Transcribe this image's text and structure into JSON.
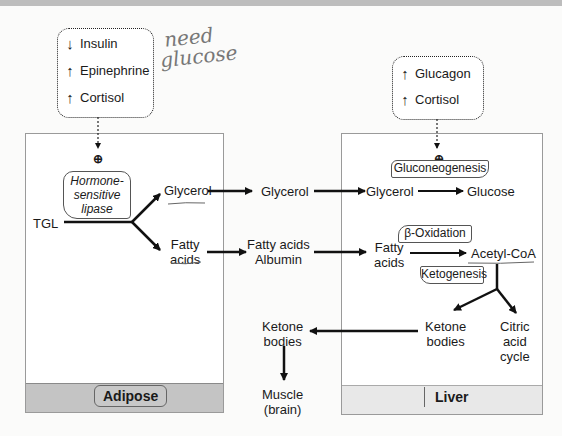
{
  "adipose_hormones": [
    {
      "direction": "down",
      "label": "Insulin"
    },
    {
      "direction": "up",
      "label": "Epinephrine"
    },
    {
      "direction": "up",
      "label": "Cortisol"
    }
  ],
  "liver_hormones": [
    {
      "direction": "up",
      "label": "Glucagon"
    },
    {
      "direction": "up",
      "label": "Cortisol"
    }
  ],
  "annotation": {
    "line1": "need",
    "line2": "glucose"
  },
  "activation_symbol": "⊕",
  "adipose": {
    "label": "Adipose",
    "enzyme": "Hormone-sensitive lipase",
    "enzyme_lines": [
      "Hormone-",
      "sensitive",
      "lipase"
    ],
    "substrate": "TGL",
    "product1": "Glycerol",
    "product2_line1": "Fatty",
    "product2_line2": "acids"
  },
  "blood": {
    "glycerol": "Glycerol",
    "fatty_acids_line1": "Fatty acids",
    "fatty_acids_line2": "Albumin",
    "ketone_line1": "Ketone",
    "ketone_line2": "bodies",
    "muscle_line1": "Muscle",
    "muscle_line2": "(brain)"
  },
  "liver": {
    "label": "Liver",
    "gluconeogenesis": "Gluconeogenesis",
    "glycerol": "Glycerol",
    "glucose": "Glucose",
    "beta_oxidation": "β-Oxidation",
    "fatty_line1": "Fatty",
    "fatty_line2": "acids",
    "acetyl_coa": "Acetyl-CoA",
    "ketogenesis": "Ketogenesis",
    "ketone_line1": "Ketone",
    "ketone_line2": "bodies",
    "citric_line1": "Citric",
    "citric_line2": "acid",
    "citric_line3": "cycle"
  },
  "arrows": {
    "up": "↑",
    "down": "↓"
  }
}
